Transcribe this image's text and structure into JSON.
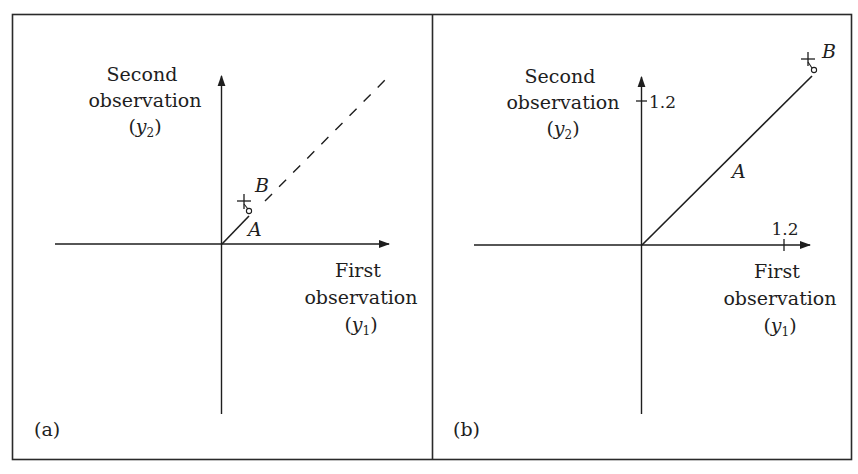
{
  "figure": {
    "colors": {
      "ink": "#1e1e1e",
      "frame": "#2a2a2a",
      "background": "#ffffff"
    },
    "panels": [
      {
        "id": "a",
        "panel_label": "(a)",
        "y_axis_title": {
          "line1": "Second",
          "line2": "observation",
          "line3_open": "(",
          "line3_var": "y",
          "line3_sub": "2",
          "line3_close": ")"
        },
        "x_axis_title": {
          "line1": "First",
          "line2": "observation",
          "line3_open": "(",
          "line3_var": "y",
          "line3_sub": "1",
          "line3_close": ")"
        },
        "vector_label": "A",
        "point_label": "B",
        "line_style_extension": "dashed"
      },
      {
        "id": "b",
        "panel_label": "(b)",
        "y_axis_title": {
          "line1": "Second",
          "line2": "observation",
          "line3_open": "(",
          "line3_var": "y",
          "line3_sub": "2",
          "line3_close": ")"
        },
        "x_axis_title": {
          "line1": "First",
          "line2": "observation",
          "line3_open": "(",
          "line3_var": "y",
          "line3_sub": "1",
          "line3_close": ")"
        },
        "y_tick_label": "1.2",
        "x_tick_label": "1.2",
        "vector_label": "A",
        "point_label": "B"
      }
    ]
  }
}
